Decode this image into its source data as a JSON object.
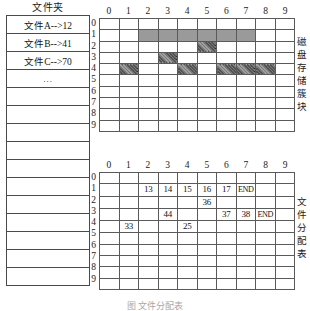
{
  "folder": {
    "title": "文件夹",
    "rows": [
      "文件A-->12",
      "文件B-->41",
      "文件C-->70",
      "...",
      "",
      "",
      "",
      "",
      "",
      "",
      "",
      "",
      "",
      "",
      ""
    ]
  },
  "disk": {
    "label_chars": [
      "磁",
      "盘",
      "存",
      "储",
      "簇",
      "块"
    ],
    "col_headers": [
      "0",
      "1",
      "2",
      "3",
      "4",
      "5",
      "6",
      "7",
      "8",
      "9"
    ],
    "row_headers": [
      "0",
      "1",
      "2",
      "3",
      "4",
      "5",
      "6",
      "7",
      "8",
      "9"
    ],
    "rows": 10,
    "cols": 10,
    "solid_color": "#9a9a9a",
    "hatch_color": "#7f7f7f",
    "solid_cells": [
      {
        "r": 1,
        "c": 2
      },
      {
        "r": 1,
        "c": 3
      },
      {
        "r": 1,
        "c": 4
      },
      {
        "r": 1,
        "c": 5
      },
      {
        "r": 1,
        "c": 6
      },
      {
        "r": 1,
        "c": 7
      }
    ],
    "hatch_cells": [
      {
        "r": 2,
        "c": 5
      },
      {
        "r": 3,
        "c": 3
      },
      {
        "r": 4,
        "c": 1
      },
      {
        "r": 4,
        "c": 4
      },
      {
        "r": 4,
        "c": 6
      },
      {
        "r": 4,
        "c": 7
      },
      {
        "r": 4,
        "c": 8
      }
    ]
  },
  "fat": {
    "label_chars": [
      "文",
      "件",
      "分",
      "配",
      "表"
    ],
    "col_headers": [
      "0",
      "1",
      "2",
      "3",
      "4",
      "5",
      "6",
      "7",
      "8",
      "9"
    ],
    "row_headers": [
      "0",
      "1",
      "2",
      "3",
      "4",
      "5",
      "6",
      "7",
      "8",
      "9"
    ],
    "rows": 10,
    "cols": 10,
    "values": [
      {
        "r": 1,
        "c": 2,
        "v": "13"
      },
      {
        "r": 1,
        "c": 3,
        "v": "14"
      },
      {
        "r": 1,
        "c": 4,
        "v": "15"
      },
      {
        "r": 1,
        "c": 5,
        "v": "16"
      },
      {
        "r": 1,
        "c": 6,
        "v": "17"
      },
      {
        "r": 1,
        "c": 7,
        "v": "END"
      },
      {
        "r": 2,
        "c": 5,
        "v": "36"
      },
      {
        "r": 3,
        "c": 3,
        "v": "44"
      },
      {
        "r": 3,
        "c": 6,
        "v": "37"
      },
      {
        "r": 3,
        "c": 7,
        "v": "38"
      },
      {
        "r": 3,
        "c": 8,
        "v": "END"
      },
      {
        "r": 4,
        "c": 1,
        "v": "33"
      },
      {
        "r": 4,
        "c": 4,
        "v": "25"
      }
    ]
  },
  "caption": "图 文件分配表"
}
